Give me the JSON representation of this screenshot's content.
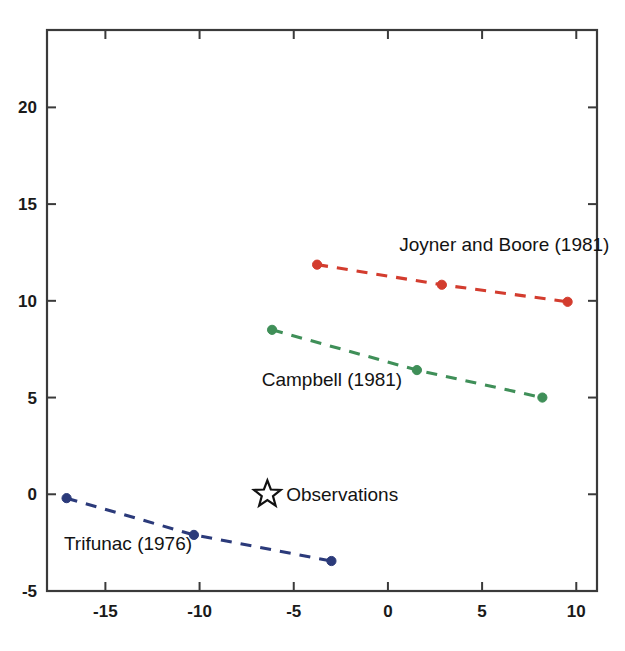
{
  "chart_data": {
    "type": "line",
    "title": "",
    "xlabel": "",
    "ylabel": "",
    "xlim": [
      -18.1,
      11.1
    ],
    "ylim": [
      -5,
      24.0
    ],
    "xticks": [
      -15,
      -10,
      -5,
      0,
      5,
      10
    ],
    "xtick_labels": [
      "-15",
      "-10",
      "-5",
      "0",
      "5",
      "10"
    ],
    "yticks": [
      -5,
      0,
      5,
      10,
      15,
      20
    ],
    "ytick_labels": [
      "-5",
      "0",
      "5",
      "10",
      "15",
      "20"
    ],
    "grid": false,
    "legend_position": "inline-annotations",
    "series": [
      {
        "name": "Joyner and Boore (1981)",
        "color": "#d33c2e",
        "linestyle": "dashed",
        "marker": "circle",
        "x": [
          -3.76,
          2.86,
          9.54
        ],
        "y": [
          11.87,
          10.83,
          9.95
        ],
        "label_text": "Joyner and Boore (1981)",
        "label_x": 0.6,
        "label_y": 12.6
      },
      {
        "name": "Campbell (1981)",
        "color": "#3f8f58",
        "linestyle": "dashed",
        "marker": "circle",
        "x": [
          -6.15,
          1.54,
          8.2
        ],
        "y": [
          8.5,
          6.42,
          5.0
        ],
        "label_text": "Campbell (1981)",
        "label_x": -6.7,
        "label_y": 5.6
      },
      {
        "name": "Trifunac (1976)",
        "color": "#2b3a7a",
        "linestyle": "dashed",
        "marker": "circle",
        "x": [
          -17.06,
          -10.3,
          -3.0
        ],
        "y": [
          -0.2,
          -2.1,
          -3.45
        ],
        "label_text": "Trifunac (1976)",
        "label_x": -17.2,
        "label_y": -2.9
      }
    ],
    "legend_markers": [
      {
        "name": "Observations",
        "marker": "star-open",
        "color": "#111111",
        "x": -6.4,
        "y": 0.0,
        "label_text": "Observations",
        "label_x": -5.4,
        "label_y": 0.0
      }
    ]
  },
  "axes": {
    "box_color": "#3a3a3a",
    "background": "#ffffff",
    "tick_direction": "in"
  },
  "icons": {
    "star": "star-open-icon"
  }
}
